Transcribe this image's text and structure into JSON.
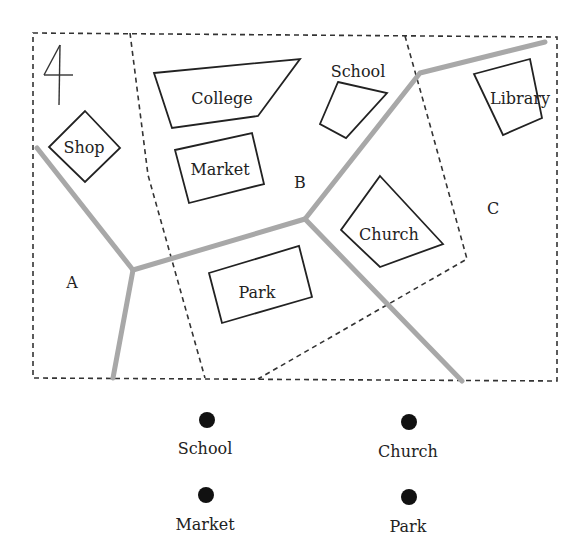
{
  "map": {
    "north_symbol": "4",
    "regions": [
      {
        "label": "A",
        "x": 72,
        "y": 288
      },
      {
        "label": "B",
        "x": 300,
        "y": 188
      },
      {
        "label": "C",
        "x": 493,
        "y": 214
      }
    ],
    "buildings": [
      {
        "name": "Shop",
        "points": "85,111 120,148 85,182 49,147",
        "label_x": 84,
        "label_y": 153
      },
      {
        "name": "College",
        "points": "154,73 300,59 258,116 172,128",
        "label_x": 222,
        "label_y": 104
      },
      {
        "name": "Market",
        "points": "175,150 252,133 264,184 189,203",
        "label_x": 220,
        "label_y": 175
      },
      {
        "name": "School",
        "points": "338,82 387,93 346,138 320,124",
        "label_x": 358,
        "label_y": 77
      },
      {
        "name": "Library",
        "points": "474,74 530,59 542,118 503,135",
        "label_x": 520,
        "label_y": 104
      },
      {
        "name": "Church",
        "points": "380,176 443,244 380,267 341,230",
        "label_x": 389,
        "label_y": 240
      },
      {
        "name": "Park",
        "points": "209,273 299,246 312,297 222,323",
        "label_x": 257,
        "label_y": 298
      }
    ],
    "colors": {
      "road": "#a8a8a8",
      "boundary": "#333333",
      "building_stroke": "#222222"
    }
  },
  "legend": {
    "items": [
      {
        "label": "School",
        "dot_x": 207,
        "dot_y": 420,
        "label_x": 205,
        "label_y": 454
      },
      {
        "label": "Church",
        "dot_x": 409,
        "dot_y": 422,
        "label_x": 408,
        "label_y": 457
      },
      {
        "label": "Market",
        "dot_x": 206,
        "dot_y": 495,
        "label_x": 205,
        "label_y": 530
      },
      {
        "label": "Park",
        "dot_x": 409,
        "dot_y": 497,
        "label_x": 408,
        "label_y": 532
      }
    ]
  }
}
